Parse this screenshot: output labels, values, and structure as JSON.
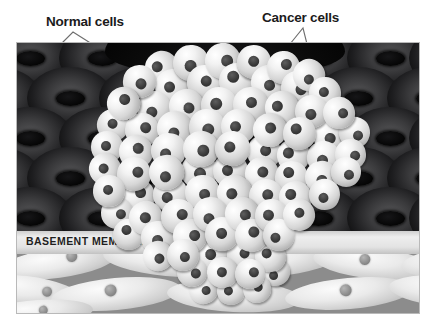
{
  "figure": {
    "type": "biological-illustration",
    "width": 435,
    "height": 330,
    "background_color": "#ffffff"
  },
  "labels": {
    "normal_cells": "Normal cells",
    "cancer_cells": "Cancer cells",
    "basement_membrane": "BASEMENT MEMBRANE"
  },
  "colors": {
    "page_background": "#ffffff",
    "label_text": "#1b1b1b",
    "epithelium_background": "#060606",
    "normal_cell_body": "#3a3a3c",
    "normal_cell_nucleus": "#050505",
    "basement_membrane_band": "#e3e3e3",
    "basement_membrane_text": "#1f1f1f",
    "stroma_background": "#8c8c8c",
    "stroma_cell_body": "#eaeaea",
    "stroma_cell_nucleus": "#8f8f8f",
    "cancer_cell_body": "#f2f2f2",
    "cancer_cell_nucleus": "#3a3a3a",
    "frame_border": "#b9b9b9",
    "leader_line": "#6e6e6e"
  },
  "regions": [
    {
      "name": "epithelium",
      "label": "Normal cells",
      "description": "Dark epithelial tissue layer containing regularly spaced normal cells with elliptical nuclei"
    },
    {
      "name": "tumor-mass",
      "label": "Cancer cells",
      "description": "Dense cluster of pale disorganized cancer cells bulging upward and invading downward through the basement membrane"
    },
    {
      "name": "basement-membrane",
      "label": "BASEMENT MEMBRANE",
      "description": "Pale horizontal band separating epithelium from underlying connective tissue, breached by the tumor"
    },
    {
      "name": "stroma",
      "label": "",
      "description": "Underlying connective tissue with elongated spindle-shaped cells on a gray matrix"
    }
  ],
  "normal_cells": {
    "rows": 5,
    "columns": 6,
    "arrangement": "staggered grid",
    "cell_width": 86,
    "cell_height": 62,
    "positions": [
      {
        "x": -30,
        "y": -16
      },
      {
        "x": 42,
        "y": -16
      },
      {
        "x": 114,
        "y": -16
      },
      {
        "x": 186,
        "y": -16
      },
      {
        "x": 258,
        "y": -16
      },
      {
        "x": 330,
        "y": -16
      },
      {
        "x": 392,
        "y": -16
      },
      {
        "x": -62,
        "y": 24
      },
      {
        "x": 10,
        "y": 24
      },
      {
        "x": 82,
        "y": 24
      },
      {
        "x": 154,
        "y": 24
      },
      {
        "x": 226,
        "y": 24
      },
      {
        "x": 298,
        "y": 24
      },
      {
        "x": 370,
        "y": 24
      },
      {
        "x": -30,
        "y": 64
      },
      {
        "x": 42,
        "y": 64
      },
      {
        "x": 114,
        "y": 64
      },
      {
        "x": 186,
        "y": 64
      },
      {
        "x": 258,
        "y": 64
      },
      {
        "x": 330,
        "y": 64
      },
      {
        "x": 392,
        "y": 64
      },
      {
        "x": -62,
        "y": 104
      },
      {
        "x": 10,
        "y": 104
      },
      {
        "x": 82,
        "y": 104
      },
      {
        "x": 154,
        "y": 104
      },
      {
        "x": 226,
        "y": 104
      },
      {
        "x": 298,
        "y": 104
      },
      {
        "x": 370,
        "y": 104
      },
      {
        "x": -30,
        "y": 144
      },
      {
        "x": 42,
        "y": 144
      },
      {
        "x": 114,
        "y": 144
      },
      {
        "x": 186,
        "y": 144
      },
      {
        "x": 258,
        "y": 144
      },
      {
        "x": 330,
        "y": 144
      },
      {
        "x": 392,
        "y": 144
      }
    ]
  },
  "stroma_cells": [
    {
      "x": -18,
      "y": -6,
      "w": 118,
      "h": 30,
      "r": -8,
      "nx": 0.62,
      "ny": 0.34,
      "nd": 11
    },
    {
      "x": 86,
      "y": -10,
      "w": 128,
      "h": 32,
      "r": 5,
      "nx": 0.44,
      "ny": 0.42,
      "nd": 12
    },
    {
      "x": 198,
      "y": -8,
      "w": 120,
      "h": 30,
      "r": -4,
      "nx": 0.4,
      "ny": 0.38,
      "nd": 11
    },
    {
      "x": 296,
      "y": -6,
      "w": 122,
      "h": 31,
      "r": 6,
      "nx": 0.42,
      "ny": 0.4,
      "nd": 11
    },
    {
      "x": 384,
      "y": -8,
      "w": 112,
      "h": 30,
      "r": -6,
      "nx": 0.38,
      "ny": 0.38,
      "nd": 11
    },
    {
      "x": -48,
      "y": 22,
      "w": 112,
      "h": 30,
      "r": 7,
      "nx": 0.7,
      "ny": 0.44,
      "nd": 10
    },
    {
      "x": 34,
      "y": 24,
      "w": 130,
      "h": 32,
      "r": -5,
      "nx": 0.46,
      "ny": 0.38,
      "nd": 12
    },
    {
      "x": 150,
      "y": 26,
      "w": 134,
      "h": 32,
      "r": 3,
      "nx": 0.45,
      "ny": 0.4,
      "nd": 13
    },
    {
      "x": 268,
      "y": 24,
      "w": 128,
      "h": 31,
      "r": -5,
      "nx": 0.48,
      "ny": 0.38,
      "nd": 12
    },
    {
      "x": 372,
      "y": 22,
      "w": 120,
      "h": 31,
      "r": 5,
      "nx": 0.42,
      "ny": 0.4,
      "nd": 11
    },
    {
      "x": -34,
      "y": 46,
      "w": 110,
      "h": 26,
      "r": -4,
      "nx": 0.55,
      "ny": 0.4,
      "nd": 9
    }
  ],
  "cancer_cells": {
    "count": 96,
    "cell_size_range": [
      26,
      40
    ],
    "nucleus_ratio": 0.32,
    "description": "Pale rounded cells with dark round nuclei packed irregularly in a dome-shaped mass",
    "cells": [
      {
        "x": 128,
        "y": 8,
        "s": 34
      },
      {
        "x": 156,
        "y": 2,
        "s": 36
      },
      {
        "x": 188,
        "y": 0,
        "s": 36
      },
      {
        "x": 220,
        "y": 2,
        "s": 34
      },
      {
        "x": 250,
        "y": 8,
        "s": 33
      },
      {
        "x": 276,
        "y": 16,
        "s": 32
      },
      {
        "x": 106,
        "y": 22,
        "s": 33
      },
      {
        "x": 138,
        "y": 26,
        "s": 35
      },
      {
        "x": 170,
        "y": 22,
        "s": 35
      },
      {
        "x": 202,
        "y": 20,
        "s": 36
      },
      {
        "x": 234,
        "y": 22,
        "s": 35
      },
      {
        "x": 264,
        "y": 28,
        "s": 33
      },
      {
        "x": 292,
        "y": 34,
        "s": 32
      },
      {
        "x": 90,
        "y": 44,
        "s": 33
      },
      {
        "x": 120,
        "y": 48,
        "s": 34
      },
      {
        "x": 152,
        "y": 46,
        "s": 35
      },
      {
        "x": 184,
        "y": 44,
        "s": 36
      },
      {
        "x": 216,
        "y": 44,
        "s": 35
      },
      {
        "x": 248,
        "y": 48,
        "s": 34
      },
      {
        "x": 278,
        "y": 52,
        "s": 33
      },
      {
        "x": 306,
        "y": 54,
        "s": 32
      },
      {
        "x": 80,
        "y": 66,
        "s": 32
      },
      {
        "x": 108,
        "y": 70,
        "s": 34
      },
      {
        "x": 140,
        "y": 68,
        "s": 35
      },
      {
        "x": 172,
        "y": 66,
        "s": 36
      },
      {
        "x": 204,
        "y": 66,
        "s": 35
      },
      {
        "x": 236,
        "y": 70,
        "s": 34
      },
      {
        "x": 266,
        "y": 74,
        "s": 33
      },
      {
        "x": 296,
        "y": 76,
        "s": 33
      },
      {
        "x": 322,
        "y": 74,
        "s": 31
      },
      {
        "x": 74,
        "y": 88,
        "s": 32
      },
      {
        "x": 102,
        "y": 92,
        "s": 34
      },
      {
        "x": 134,
        "y": 90,
        "s": 35
      },
      {
        "x": 166,
        "y": 88,
        "s": 36
      },
      {
        "x": 198,
        "y": 88,
        "s": 35
      },
      {
        "x": 230,
        "y": 92,
        "s": 34
      },
      {
        "x": 260,
        "y": 96,
        "s": 33
      },
      {
        "x": 290,
        "y": 98,
        "s": 33
      },
      {
        "x": 318,
        "y": 96,
        "s": 31
      },
      {
        "x": 72,
        "y": 110,
        "s": 32
      },
      {
        "x": 100,
        "y": 114,
        "s": 34
      },
      {
        "x": 132,
        "y": 112,
        "s": 35
      },
      {
        "x": 164,
        "y": 110,
        "s": 36
      },
      {
        "x": 196,
        "y": 110,
        "s": 35
      },
      {
        "x": 228,
        "y": 114,
        "s": 34
      },
      {
        "x": 258,
        "y": 118,
        "s": 33
      },
      {
        "x": 288,
        "y": 118,
        "s": 33
      },
      {
        "x": 314,
        "y": 114,
        "s": 30
      },
      {
        "x": 76,
        "y": 132,
        "s": 32
      },
      {
        "x": 104,
        "y": 136,
        "s": 34
      },
      {
        "x": 136,
        "y": 134,
        "s": 35
      },
      {
        "x": 168,
        "y": 132,
        "s": 35
      },
      {
        "x": 200,
        "y": 132,
        "s": 35
      },
      {
        "x": 232,
        "y": 136,
        "s": 34
      },
      {
        "x": 262,
        "y": 138,
        "s": 33
      },
      {
        "x": 292,
        "y": 136,
        "s": 31
      },
      {
        "x": 84,
        "y": 154,
        "s": 32
      },
      {
        "x": 112,
        "y": 158,
        "s": 34
      },
      {
        "x": 144,
        "y": 156,
        "s": 35
      },
      {
        "x": 176,
        "y": 154,
        "s": 35
      },
      {
        "x": 208,
        "y": 154,
        "s": 34
      },
      {
        "x": 238,
        "y": 156,
        "s": 33
      },
      {
        "x": 266,
        "y": 156,
        "s": 32
      },
      {
        "x": 96,
        "y": 176,
        "s": 31
      },
      {
        "x": 124,
        "y": 178,
        "s": 33
      },
      {
        "x": 156,
        "y": 176,
        "s": 34
      },
      {
        "x": 188,
        "y": 174,
        "s": 34
      },
      {
        "x": 218,
        "y": 176,
        "s": 33
      },
      {
        "x": 246,
        "y": 176,
        "s": 32
      },
      {
        "x": 150,
        "y": 196,
        "s": 32
      },
      {
        "x": 180,
        "y": 194,
        "s": 33
      },
      {
        "x": 210,
        "y": 196,
        "s": 32
      },
      {
        "x": 238,
        "y": 198,
        "s": 31
      },
      {
        "x": 126,
        "y": 198,
        "s": 30
      },
      {
        "x": 160,
        "y": 214,
        "s": 30
      },
      {
        "x": 190,
        "y": 214,
        "s": 31
      },
      {
        "x": 218,
        "y": 216,
        "s": 30
      },
      {
        "x": 244,
        "y": 214,
        "s": 29
      },
      {
        "x": 172,
        "y": 232,
        "s": 29
      },
      {
        "x": 200,
        "y": 234,
        "s": 28
      },
      {
        "x": 226,
        "y": 232,
        "s": 28
      }
    ]
  },
  "leader_lines": [
    {
      "name": "normal-cells-pointer",
      "shape": "caret",
      "apex_x": 73,
      "apex_y": 32,
      "left_x": 61,
      "left_y": 44,
      "right_x": 92,
      "right_y": 44
    },
    {
      "name": "cancer-cells-pointer",
      "shape": "caret",
      "apex_x": 303,
      "apex_y": 28,
      "left_x": 290,
      "left_y": 44,
      "right_x": 307,
      "right_y": 44
    }
  ]
}
